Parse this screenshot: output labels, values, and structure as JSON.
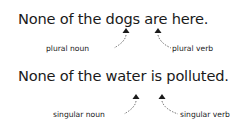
{
  "examples": [
    {
      "sentence": "None of the dogs are here.",
      "noun_label": "plural noun",
      "verb_label": "plural verb"
    },
    {
      "sentence": "None of the water is polluted.",
      "noun_label": "singular noun",
      "verb_label": "singular verb"
    }
  ],
  "colors": {
    "text": "#1a1a1a",
    "background": "#ffffff"
  }
}
